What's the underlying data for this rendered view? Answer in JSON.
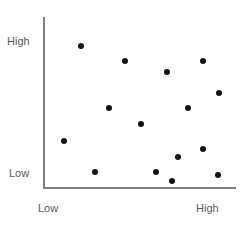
{
  "chart_data": {
    "type": "scatter",
    "title": "",
    "xlabel": "",
    "ylabel": "",
    "xlim": [
      0,
      100
    ],
    "ylim": [
      0,
      100
    ],
    "grid": false,
    "legend": null,
    "x_tick_labels": [
      "Low",
      "High"
    ],
    "y_tick_labels": [
      "Low",
      "High"
    ],
    "point_color": "#141414",
    "axis_color": "#808080",
    "label_color": "#595959",
    "n_points": 15,
    "points": [
      {
        "x": 19.2,
        "y": 83.1
      },
      {
        "x": 42.0,
        "y": 74.4
      },
      {
        "x": 64.2,
        "y": 67.4
      },
      {
        "x": 82.9,
        "y": 74.4
      },
      {
        "x": 91.2,
        "y": 55.2
      },
      {
        "x": 33.7,
        "y": 46.5
      },
      {
        "x": 75.1,
        "y": 46.5
      },
      {
        "x": 50.3,
        "y": 37.2
      },
      {
        "x": 10.4,
        "y": 27.3
      },
      {
        "x": 82.9,
        "y": 22.1
      },
      {
        "x": 69.9,
        "y": 17.4
      },
      {
        "x": 26.4,
        "y": 8.7
      },
      {
        "x": 58.5,
        "y": 8.7
      },
      {
        "x": 90.7,
        "y": 7.0
      },
      {
        "x": 66.8,
        "y": 3.5
      }
    ]
  },
  "axes": {
    "y_high_label": "High",
    "y_low_label": "Low",
    "x_low_label": "Low",
    "x_high_label": "High"
  }
}
